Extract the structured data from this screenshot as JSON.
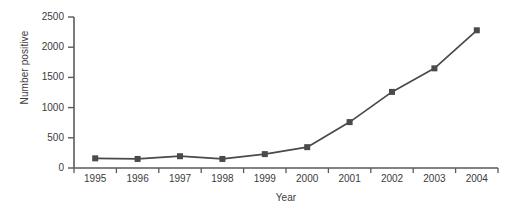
{
  "chart_data": {
    "type": "line",
    "title": "",
    "xlabel": "Year",
    "ylabel": "Number positive",
    "categories": [
      "1995",
      "1996",
      "1997",
      "1998",
      "1999",
      "2000",
      "2001",
      "2002",
      "2003",
      "2004"
    ],
    "values": [
      160,
      150,
      195,
      150,
      230,
      345,
      760,
      1260,
      1650,
      2280
    ],
    "series": [
      {
        "name": "Number positive",
        "values": [
          160,
          150,
          195,
          150,
          230,
          345,
          760,
          1260,
          1650,
          2280
        ]
      }
    ],
    "ylim": [
      0,
      2500
    ],
    "yticks": [
      0,
      500,
      1000,
      1500,
      2000,
      2500
    ],
    "ytick_labels": [
      "0",
      "500",
      "1000",
      "1500",
      "2000",
      "2500"
    ],
    "grid": false,
    "legend": "none",
    "marker": "square",
    "line_color": "#4a4a4a",
    "marker_color": "#4a4a4a",
    "axis_color": "#5a5a5a",
    "background_color": "#ffffff"
  }
}
